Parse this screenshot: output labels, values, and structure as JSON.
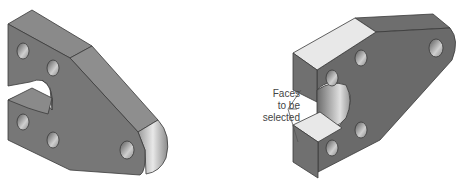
{
  "figure": {
    "views": [
      {
        "name": "left-view",
        "description": "Isometric bracket, front face visible with slot and holes"
      },
      {
        "name": "right-view",
        "description": "Isometric bracket from opposite side with two highlighted slot faces"
      }
    ],
    "callout": {
      "lines": [
        "Faces",
        "to be",
        "selected"
      ]
    },
    "colors": {
      "body": "#7a7a7a",
      "body_dark": "#5e5e5e",
      "top_face": "#8c8c8c",
      "highlight_face": "#e6e6e6",
      "edge": "#3a3a3a",
      "leader": "#555555"
    }
  }
}
